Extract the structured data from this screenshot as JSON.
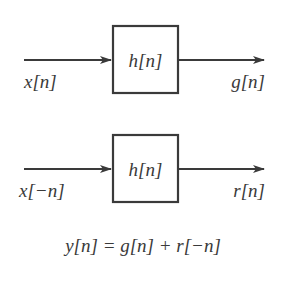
{
  "diagram": {
    "type": "block-diagram",
    "colors": {
      "stroke": "#3a3a3a",
      "background": "#ffffff"
    },
    "systems": [
      {
        "input_label": "x[n]",
        "block_label": "h[n]",
        "output_label": "g[n]"
      },
      {
        "input_label": "x[−n]",
        "block_label": "h[n]",
        "output_label": "r[n]"
      }
    ],
    "equation": "y[n] = g[n] + r[−n]"
  }
}
